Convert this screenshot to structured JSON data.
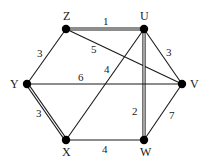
{
  "diagram": {
    "type": "weighted-graph",
    "nodes": [
      {
        "id": "Z",
        "label": "Z",
        "x": 66,
        "y": 29,
        "lx": 63,
        "ly": 20
      },
      {
        "id": "U",
        "label": "U",
        "x": 144,
        "y": 29,
        "lx": 140,
        "ly": 20
      },
      {
        "id": "V",
        "label": "V",
        "x": 182,
        "y": 84,
        "lx": 190,
        "ly": 88
      },
      {
        "id": "W",
        "label": "W",
        "x": 144,
        "y": 140,
        "lx": 140,
        "ly": 156
      },
      {
        "id": "X",
        "label": "X",
        "x": 66,
        "y": 140,
        "lx": 62,
        "ly": 156
      },
      {
        "id": "Y",
        "label": "Y",
        "x": 27,
        "y": 84,
        "lx": 10,
        "ly": 88
      }
    ],
    "edges": [
      {
        "from": "Z",
        "to": "U",
        "weight": "1",
        "double": true,
        "wx": 103,
        "wy": 25
      },
      {
        "from": "Z",
        "to": "Y",
        "weight": "3",
        "double": false,
        "wx": 37,
        "wy": 57
      },
      {
        "from": "Z",
        "to": "V",
        "weight": "5",
        "double": false,
        "wx": 91,
        "wy": 53
      },
      {
        "from": "U",
        "to": "V",
        "weight": "3",
        "double": false,
        "wx": 166,
        "wy": 56
      },
      {
        "from": "U",
        "to": "X",
        "weight": "4",
        "double": false,
        "wx": 104,
        "wy": 73
      },
      {
        "from": "U",
        "to": "W",
        "weight": "2",
        "double": true,
        "wx": 132,
        "wy": 115
      },
      {
        "from": "Y",
        "to": "V",
        "weight": "6",
        "double": false,
        "wx": 78,
        "wy": 81
      },
      {
        "from": "Y",
        "to": "X",
        "weight": "3",
        "double": true,
        "wx": 36,
        "wy": 117
      },
      {
        "from": "X",
        "to": "W",
        "weight": "4",
        "double": false,
        "wx": 102,
        "wy": 153
      },
      {
        "from": "W",
        "to": "V",
        "weight": "7",
        "double": false,
        "wx": 169,
        "wy": 119
      }
    ]
  }
}
